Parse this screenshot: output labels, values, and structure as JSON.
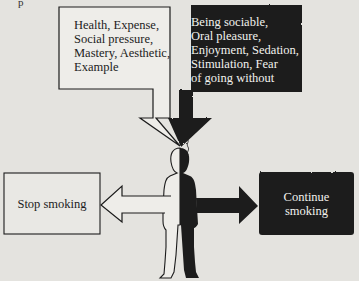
{
  "diagram": {
    "type": "decision-diagram",
    "corner_mark": "p",
    "reasons_to_stop": {
      "text": "Health, Expense,\nSocial pressure,\nMastery, Aesthetic,\nExample",
      "items": [
        "Health",
        "Expense",
        "Social pressure",
        "Mastery",
        "Aesthetic",
        "Example"
      ],
      "style": "white-box"
    },
    "reasons_to_continue": {
      "text": "Being sociable,\nOral pleasure,\nEnjoyment, Sedation,\nStimulation, Fear\nof going without",
      "items": [
        "Being sociable",
        "Oral pleasure",
        "Enjoyment",
        "Sedation",
        "Stimulation",
        "Fear of going without"
      ],
      "style": "black-scalloped-box"
    },
    "outcome_stop": {
      "text": "Stop smoking",
      "style": "white-box"
    },
    "outcome_continue": {
      "text": "Continue\nsmoking",
      "style": "black-scalloped-box"
    },
    "colors": {
      "background": "#e4e3df",
      "ink": "#1c1c1c",
      "white_fill": "#eeede9",
      "light_text": "#f2f2ee"
    }
  }
}
